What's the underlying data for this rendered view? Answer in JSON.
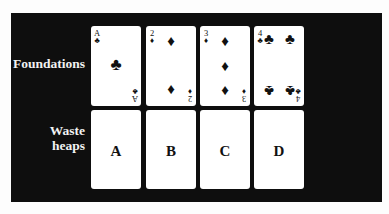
{
  "labels": {
    "foundations": "Foundations",
    "waste_line1": "Waste",
    "waste_line2": "heaps"
  },
  "foundations": [
    {
      "rank": "A",
      "suit": "♣",
      "suit_name": "clubs",
      "pips": [
        "♣"
      ]
    },
    {
      "rank": "2",
      "suit": "♦",
      "suit_name": "diamonds",
      "pips": [
        "♦",
        "♦"
      ]
    },
    {
      "rank": "3",
      "suit": "♦",
      "suit_name": "diamonds",
      "pips": [
        "♦",
        "♦",
        "♦"
      ]
    },
    {
      "rank": "4",
      "suit": "♣",
      "suit_name": "clubs",
      "pips": [
        "♣",
        "♣",
        "♣",
        "♣"
      ]
    }
  ],
  "waste_heaps": [
    {
      "label": "A"
    },
    {
      "label": "B"
    },
    {
      "label": "C"
    },
    {
      "label": "D"
    }
  ],
  "colors": {
    "panel": "#0e0e0e",
    "card": "#ffffff",
    "label_text": "#f2f2f2"
  }
}
